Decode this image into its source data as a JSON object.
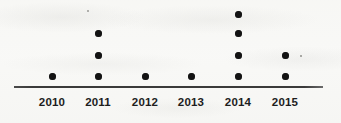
{
  "chart_data": {
    "type": "scatter",
    "plot_style": "dot-plot",
    "title": "",
    "subtitle": "",
    "xlabel": "",
    "ylabel": "",
    "categories": [
      "2010",
      "2011",
      "2012",
      "2013",
      "2014",
      "2015"
    ],
    "values": [
      1,
      3,
      1,
      1,
      4,
      2
    ],
    "series": [
      {
        "name": "count",
        "values": [
          1,
          3,
          1,
          1,
          4,
          2
        ]
      }
    ],
    "points": [
      {
        "category": "2010",
        "stack_index": 1
      },
      {
        "category": "2011",
        "stack_index": 1
      },
      {
        "category": "2011",
        "stack_index": 2
      },
      {
        "category": "2011",
        "stack_index": 3
      },
      {
        "category": "2012",
        "stack_index": 1
      },
      {
        "category": "2013",
        "stack_index": 1
      },
      {
        "category": "2014",
        "stack_index": 1
      },
      {
        "category": "2014",
        "stack_index": 2
      },
      {
        "category": "2014",
        "stack_index": 3
      },
      {
        "category": "2014",
        "stack_index": 4
      },
      {
        "category": "2015",
        "stack_index": 1
      },
      {
        "category": "2015",
        "stack_index": 2
      }
    ],
    "ylim": [
      0,
      4
    ],
    "grid": false,
    "legend": false,
    "legend_position": "none",
    "dot_color": "#131313",
    "axis_color": "#3a3a3a",
    "background_color": "#f8f8f6",
    "axis_shown": [
      "x"
    ]
  },
  "axis": {
    "tick_labels": [
      "2010",
      "2011",
      "2012",
      "2013",
      "2014",
      "2015"
    ]
  },
  "layout": {
    "column_x": [
      52,
      98,
      145,
      191,
      238,
      285
    ],
    "row_y": [
      76,
      55,
      33,
      14
    ]
  }
}
